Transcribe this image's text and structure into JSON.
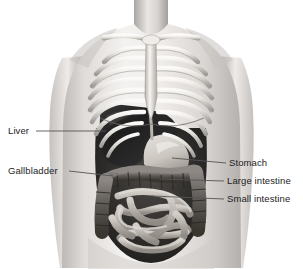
{
  "figure": {
    "width": 303,
    "height": 269,
    "background_color": "#ffffff",
    "style": "grayscale medical illustration of a human torso, front view, showing ribcage and abdominal organs",
    "text_color": "#1d1d1d",
    "leader_line_color": "#555555"
  },
  "labels": {
    "liver": "Liver",
    "gallbladder": "Gallbladder",
    "stomach": "Stomach",
    "large_intestine": "Large intestine",
    "small_intestine": "Small intestine"
  },
  "anatomy": {
    "skin_light": "#f2f0ef",
    "skin_mid": "#d8d5d3",
    "skin_shadow": "#b3afad",
    "bone_light": "#f6f4f1",
    "bone_mid": "#d2cec9",
    "bone_shadow": "#8e8a86",
    "cavity_dark": "#2e2e2e",
    "liver_color": "#232323",
    "stomach_color": "#cfcac4",
    "intestine_light": "#c9c4be",
    "intestine_dark": "#4a4744",
    "colon_color": "#5d5955"
  }
}
